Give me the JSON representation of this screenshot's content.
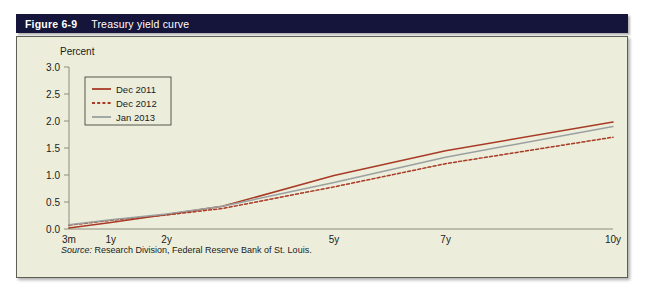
{
  "header": {
    "figure_number": "Figure 6-9",
    "title": "Treasury yield curve"
  },
  "source": {
    "lead": "Source:",
    "text": " Research Division, Federal Reserve Bank of St. Louis."
  },
  "colors": {
    "header_bg": "#15143a",
    "panel_bg": "#eceedb",
    "panel_border": "#5d5f54",
    "axis": "#8c8c80",
    "dec2011": "#a83a26",
    "dec2012": "#a83a26",
    "jan2013": "#9aa0a0",
    "text": "#1b1b1b"
  },
  "chart_data": {
    "type": "line",
    "title": "Treasury yield curve",
    "xlabel": "",
    "ylabel": "Percent",
    "ylim": [
      0.0,
      3.0
    ],
    "yticks": [
      "0.0",
      "0.5",
      "1.0",
      "1.5",
      "2.0",
      "2.5",
      "3.0"
    ],
    "ytick_values": [
      0.0,
      0.5,
      1.0,
      1.5,
      2.0,
      2.5,
      3.0
    ],
    "grid": false,
    "legend_position": "top-left",
    "x": [
      0.25,
      1,
      2,
      3,
      5,
      7,
      10
    ],
    "xtick_labels": [
      "3m",
      "1y",
      "2y",
      "5y",
      "7y",
      "10y"
    ],
    "xtick_values": [
      0.25,
      1,
      2,
      5,
      7,
      10
    ],
    "xlim": [
      0.25,
      10
    ],
    "series": [
      {
        "name": "Dec 2011",
        "color": "#a83a26",
        "style": "solid",
        "values": [
          0.02,
          0.12,
          0.27,
          0.42,
          0.99,
          1.45,
          1.98
        ]
      },
      {
        "name": "Dec 2012",
        "color": "#a83a26",
        "style": "dashed",
        "values": [
          0.07,
          0.16,
          0.26,
          0.38,
          0.78,
          1.21,
          1.7
        ]
      },
      {
        "name": "Jan 2013",
        "color": "#9aa0a0",
        "style": "solid",
        "values": [
          0.08,
          0.17,
          0.28,
          0.42,
          0.86,
          1.33,
          1.9
        ]
      }
    ]
  }
}
